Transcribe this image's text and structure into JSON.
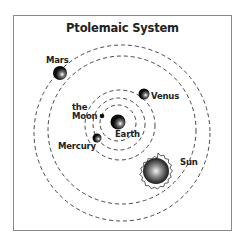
{
  "diagram": {
    "title": "Ptolemaic System",
    "bodies": {
      "earth": {
        "label": "Earth"
      },
      "moon": {
        "label_line1": "the",
        "label_line2": "Moon"
      },
      "mercury": {
        "label": "Mercury"
      },
      "venus": {
        "label": "Venus"
      },
      "sun": {
        "label": "Sun"
      },
      "mars": {
        "label": "Mars"
      }
    },
    "orbits": [
      "Moon orbit",
      "Mercury orbit",
      "Venus orbit",
      "Sun orbit",
      "Mars orbit"
    ],
    "colors": {
      "frame": "#8a8a8a",
      "orbit": "#333333",
      "planet": "#111111",
      "text": "#222222"
    }
  }
}
